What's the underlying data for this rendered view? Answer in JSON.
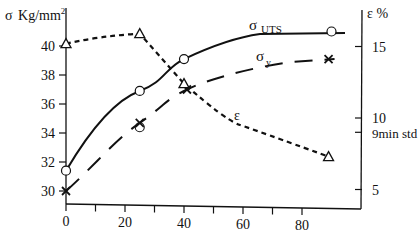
{
  "chart_data": {
    "type": "line",
    "title": "",
    "xlabel": "",
    "ylabel_left": "σ Kg/mm²",
    "ylabel_right": "ε %",
    "x_ticks": [
      0,
      20,
      40,
      60,
      80
    ],
    "x_minor_ticks": [
      10,
      30,
      50,
      70
    ],
    "xlim": [
      0,
      100
    ],
    "ylim_left": [
      29,
      42.5
    ],
    "ylim_right": [
      4,
      17
    ],
    "y_left_ticks": [
      30,
      32,
      34,
      36,
      38,
      40
    ],
    "y_right_ticks": [
      5,
      10,
      15
    ],
    "y_right_annotation": {
      "value": 9,
      "label": "9min std"
    },
    "grid": false,
    "series": [
      {
        "name": "σ UTS",
        "axis": "left",
        "marker": "circle",
        "line": "solid",
        "x": [
          0,
          25,
          40,
          90
        ],
        "y": [
          31.4,
          36.9,
          39.1,
          41.0
        ]
      },
      {
        "name": "σ y",
        "axis": "left",
        "marker": "x",
        "line": "long-dash",
        "x": [
          0,
          25,
          41,
          89
        ],
        "y": [
          30.0,
          34.7,
          37.0,
          39.1
        ]
      },
      {
        "name": "ε",
        "axis": "right",
        "marker": "triangle",
        "line": "short-dash",
        "x": [
          0,
          25,
          40,
          89
        ],
        "y": [
          15.2,
          15.9,
          12.4,
          7.3
        ]
      }
    ],
    "annotations": [
      {
        "text": "σ",
        "sub": "UTS",
        "near_series": "σ UTS"
      },
      {
        "text": "σ",
        "sub": "y",
        "near_series": "σ y"
      },
      {
        "text": "ε",
        "near_series": "ε"
      }
    ]
  },
  "labels": {
    "left_axis_sigma": "σ",
    "left_axis_unit": "Kg/mm",
    "left_axis_sup": "2",
    "right_axis": "ε %",
    "uts_sigma": "σ",
    "uts_sub": "UTS",
    "y_sigma": "σ",
    "y_sub": "y",
    "eps": "ε",
    "minstd": "9min std"
  }
}
